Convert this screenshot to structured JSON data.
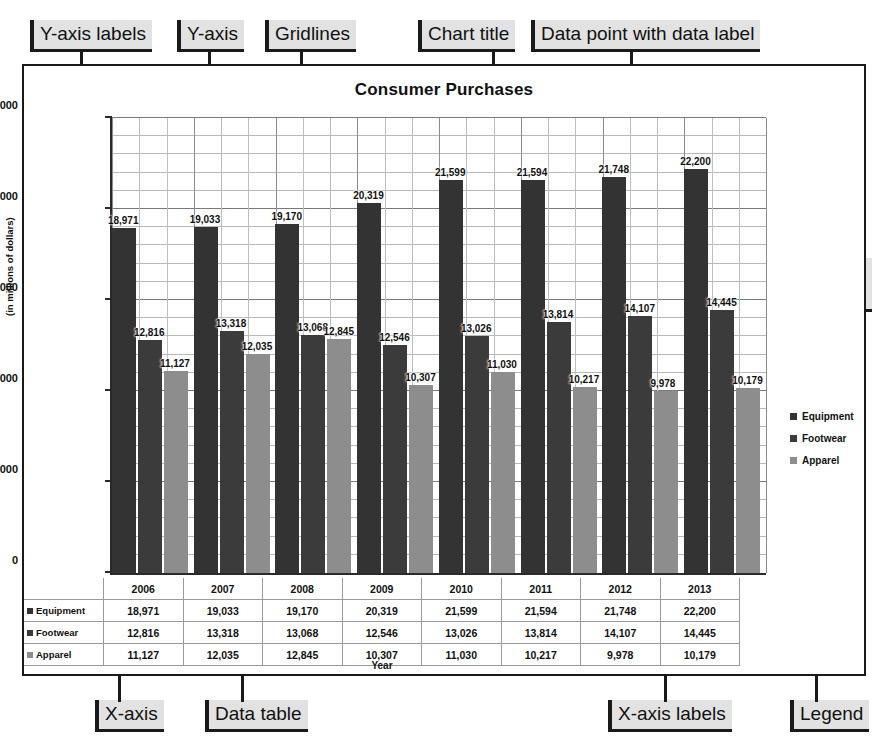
{
  "chart_data": {
    "type": "bar",
    "title": "Consumer Purchases",
    "xlabel": "Year",
    "ylabel": "(in millions of dollars)",
    "categories": [
      "2006",
      "2007",
      "2008",
      "2009",
      "2010",
      "2011",
      "2012",
      "2013"
    ],
    "series": [
      {
        "name": "Equipment",
        "color": "#333333",
        "values": [
          18971,
          19033,
          19170,
          20319,
          21599,
          21594,
          21748,
          22200
        ],
        "labels": [
          "18,971",
          "19,033",
          "19,170",
          "20,319",
          "21,599",
          "21,594",
          "21,748",
          "22,200"
        ]
      },
      {
        "name": "Footwear",
        "color": "#3b3b3b",
        "values": [
          12816,
          13318,
          13068,
          12546,
          13026,
          13814,
          14107,
          14445
        ],
        "labels": [
          "12,816",
          "13,318",
          "13,068",
          "12,546",
          "13,026",
          "13,814",
          "14,107",
          "14,445"
        ]
      },
      {
        "name": "Apparel",
        "color": "#8d8d8d",
        "values": [
          11127,
          12035,
          12845,
          10307,
          11030,
          10217,
          9978,
          10179
        ],
        "labels": [
          "11,127",
          "12,035",
          "12,845",
          "10,307",
          "11,030",
          "10,217",
          "9,978",
          "10,179"
        ]
      }
    ],
    "ylim": [
      0,
      25000
    ],
    "ytick_values": [
      0,
      5000,
      10000,
      15000,
      20000,
      25000
    ],
    "ytick_labels": [
      "0",
      "5,000",
      "10,000",
      "15,000",
      "20,000",
      "25,000"
    ],
    "minor_tick_step": 1000,
    "grid": true,
    "legend_position": "right",
    "data_table_visible": true
  },
  "legend": {
    "items": [
      {
        "label": "Equipment",
        "color": "#333333"
      },
      {
        "label": "Footwear",
        "color": "#3b3b3b"
      },
      {
        "label": "Apparel",
        "color": "#8d8d8d"
      }
    ]
  },
  "data_table": {
    "column_headers": [
      "2006",
      "2007",
      "2008",
      "2009",
      "2010",
      "2011",
      "2012",
      "2013"
    ],
    "rows": [
      {
        "label": "Equipment",
        "values": [
          "18,971",
          "19,033",
          "19,170",
          "20,319",
          "21,599",
          "21,594",
          "21,748",
          "22,200"
        ]
      },
      {
        "label": "Footwear",
        "values": [
          "12,816",
          "13,318",
          "13,068",
          "12,546",
          "13,026",
          "13,814",
          "14,107",
          "14,445"
        ]
      },
      {
        "label": "Apparel",
        "values": [
          "11,127",
          "12,035",
          "12,845",
          "10,307",
          "11,030",
          "10,217",
          "9,978",
          "10,179"
        ]
      }
    ]
  },
  "annotations": {
    "y_axis_labels": "Y-axis labels",
    "y_axis": "Y-axis",
    "gridlines": "Gridlines",
    "chart_title": "Chart title",
    "data_point": "Data point with data label",
    "data_series": "Data series",
    "x_axis": "X-axis",
    "data_table": "Data table",
    "x_axis_labels": "X-axis labels",
    "legend": "Legend"
  }
}
